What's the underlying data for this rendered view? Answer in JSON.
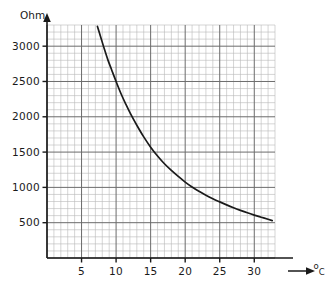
{
  "chart_data": {
    "type": "line",
    "title": "",
    "subtitle": "",
    "xlabel": "°C",
    "ylabel": "Ohm",
    "ylabel_raw": "Ohm",
    "xlabel_degree": "o",
    "xlabel_letter": "C",
    "xlim": [
      0,
      33
    ],
    "ylim": [
      0,
      3300
    ],
    "xticks": [
      5,
      10,
      15,
      20,
      25,
      30
    ],
    "yticks": [
      500,
      1000,
      1500,
      2000,
      2500,
      3000
    ],
    "xtick_labels": [
      "5",
      "10",
      "15",
      "20",
      "25",
      "30"
    ],
    "ytick_labels": [
      "500",
      "1000",
      "1500",
      "2000",
      "2500",
      "3000"
    ],
    "x_minor_step": 1,
    "y_minor_step": 100,
    "x_major_step": 5,
    "y_major_step": 500,
    "grid": true,
    "grid_minor": true,
    "legend": "none",
    "axis_arrows": true,
    "series": [
      {
        "name": "NTC resistance",
        "color": "#1a1a1a",
        "x": [
          7.3,
          7.8,
          8.3,
          8.8,
          9.3,
          10.0,
          10.7,
          11.4,
          12.1,
          13.0,
          14.0,
          15.0,
          16.0,
          17.0,
          18.0,
          19.0,
          20.0,
          21.0,
          22.0,
          23.0,
          24.0,
          25.0,
          26.0,
          27.0,
          28.0,
          29.0,
          30.0,
          31.0,
          32.0,
          32.6
        ],
        "y": [
          3280,
          3120,
          2960,
          2810,
          2680,
          2500,
          2330,
          2180,
          2040,
          1880,
          1715,
          1570,
          1445,
          1335,
          1240,
          1155,
          1075,
          1005,
          945,
          890,
          840,
          795,
          752,
          712,
          675,
          640,
          608,
          578,
          548,
          530
        ]
      }
    ],
    "colors": {
      "curve": "#1a1a1a",
      "axis": "#1a1a1a",
      "grid_major": "#6b6b6b",
      "grid_minor": "#b9b9b9",
      "background": "#ffffff",
      "text": "#1a1a1a"
    }
  },
  "axes": {
    "y_unit_label": "Ohm",
    "x_unit_degree": "o",
    "x_unit_letter": "C"
  }
}
